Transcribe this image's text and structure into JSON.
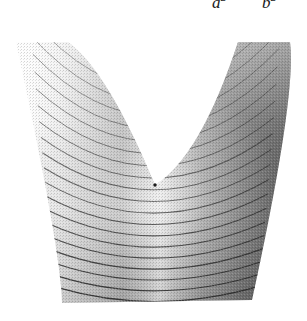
{
  "figure": {
    "kind": "3d-surface-plot",
    "background_color": "#ffffff",
    "width": 307,
    "height": 321
  },
  "labels": {
    "left": {
      "base": "a",
      "exponent": "2",
      "x": 212,
      "y": 0
    },
    "right": {
      "base": "b",
      "exponent": "2",
      "x": 262,
      "y": 0
    }
  },
  "chart_data": {
    "type": "surface",
    "title": "",
    "subtitle": "",
    "xlabel": "",
    "ylabel": "",
    "zlabel": "",
    "grid": false,
    "legend_position": "none",
    "annotations": [
      "a²",
      "b²"
    ],
    "colormap": "grayscale",
    "shading": {
      "left_arm": "#fcfcfc",
      "left_arm_inner": "#d8d8d8",
      "center_highlight": "#f2f2f2",
      "lower_left": "#9a9a9a",
      "lower_right": "#6e6e6e",
      "right_arm": "#6a6a6a",
      "right_edge": "#555555",
      "contour_line": "#2b2b2b"
    },
    "surface_extent": {
      "left_arm_top": [
        16,
        42
      ],
      "left_arm_top_right": [
        68,
        42
      ],
      "right_arm_top": [
        238,
        42
      ],
      "right_arm_top_right": [
        290,
        42
      ],
      "bottom_left": [
        62,
        303
      ],
      "bottom_right": [
        252,
        300
      ],
      "cusp": [
        155,
        185
      ]
    },
    "contour_count": 22,
    "contour_levels": [
      1,
      2,
      3,
      4,
      5,
      6,
      7,
      8,
      9,
      10,
      11,
      12,
      13,
      14,
      15,
      16,
      17,
      18,
      19,
      20,
      21,
      22
    ],
    "x": [
      -1.0,
      -0.8,
      -0.6,
      -0.4,
      -0.2,
      0.0,
      0.2,
      0.4,
      0.6,
      0.8,
      1.0
    ],
    "z_profile": [
      1.0,
      0.64,
      0.36,
      0.16,
      0.04,
      0.0,
      0.04,
      0.16,
      0.36,
      0.64,
      1.0
    ]
  }
}
